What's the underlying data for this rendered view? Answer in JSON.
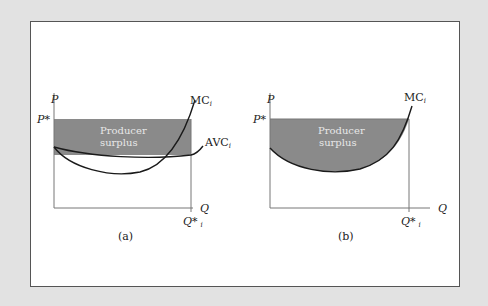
{
  "figure": {
    "panels": [
      {
        "id": "a",
        "caption": "(a)",
        "y_axis_label": "P",
        "x_axis_label": "Q",
        "price_label": "P*",
        "quantity_label": "Q*",
        "quantity_subscript": "i",
        "shaded_region_label_line1": "Producer",
        "shaded_region_label_line2": "surplus",
        "curves": [
          {
            "name": "MC",
            "subscript": "i"
          },
          {
            "name": "AVC",
            "subscript": "i"
          }
        ]
      },
      {
        "id": "b",
        "caption": "(b)",
        "y_axis_label": "P",
        "x_axis_label": "Q",
        "price_label": "P*",
        "quantity_label": "Q*",
        "quantity_subscript": "i",
        "shaded_region_label_line1": "Producer",
        "shaded_region_label_line2": "surplus",
        "curves": [
          {
            "name": "MC",
            "subscript": "i"
          }
        ]
      }
    ],
    "colors": {
      "background": "#e2e2e2",
      "panel": "#ffffff",
      "shade": "#8a8a8a",
      "line": "#1a1a1a",
      "axis": "#777777"
    }
  }
}
